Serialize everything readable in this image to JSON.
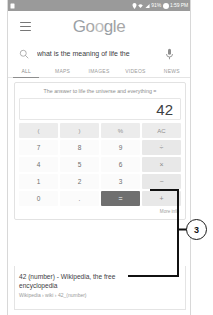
{
  "status_bar": {
    "left_icon": "app-notification-icon",
    "icons": [
      "location-icon",
      "wifi-icon",
      "signal-icon"
    ],
    "battery_percent": "91%",
    "time": "1:59 PM"
  },
  "header": {
    "menu_icon": "hamburger-menu-icon",
    "logo": {
      "letters": [
        {
          "char": "G",
          "color": "#9aa0a6"
        },
        {
          "char": "o",
          "color": "#a8a8a8"
        },
        {
          "char": "o",
          "color": "#bdbdbd"
        },
        {
          "char": "g",
          "color": "#9aa0a6"
        },
        {
          "char": "l",
          "color": "#a2a2a2"
        },
        {
          "char": "e",
          "color": "#a8a8a8"
        }
      ],
      "text": "Google"
    }
  },
  "search": {
    "icon": "search-icon",
    "query": "what is the meaning of life the",
    "placeholder": "Search",
    "mic_icon": "microphone-icon"
  },
  "tabs": [
    {
      "label": "ALL",
      "active": true
    },
    {
      "label": "MAPS",
      "active": false
    },
    {
      "label": "IMAGES",
      "active": false
    },
    {
      "label": "VIDEOS",
      "active": false
    },
    {
      "label": "NEWS",
      "active": false
    }
  ],
  "calculator": {
    "expression": "The answer to life the universe and everything =",
    "result": "42",
    "more_info_label": "More info",
    "keys": [
      {
        "label": "(",
        "type": "func"
      },
      {
        "label": ")",
        "type": "func"
      },
      {
        "label": "%",
        "type": "func"
      },
      {
        "label": "AC",
        "type": "func"
      },
      {
        "label": "7",
        "type": "num"
      },
      {
        "label": "8",
        "type": "num"
      },
      {
        "label": "9",
        "type": "num"
      },
      {
        "label": "÷",
        "type": "op"
      },
      {
        "label": "4",
        "type": "num"
      },
      {
        "label": "5",
        "type": "num"
      },
      {
        "label": "6",
        "type": "num"
      },
      {
        "label": "×",
        "type": "op"
      },
      {
        "label": "1",
        "type": "num"
      },
      {
        "label": "2",
        "type": "num"
      },
      {
        "label": "3",
        "type": "num"
      },
      {
        "label": "−",
        "type": "op"
      },
      {
        "label": "0",
        "type": "num"
      },
      {
        "label": ".",
        "type": "num"
      },
      {
        "label": "=",
        "type": "equals"
      },
      {
        "label": "+",
        "type": "op"
      }
    ]
  },
  "result": {
    "title": "42 (number) - Wikipedia, the free encyclopedia",
    "url": "Wikipedia › wiki › 42_(number)"
  },
  "annotation": {
    "marker_label": "3",
    "marker_color": "#1a1a1a"
  }
}
